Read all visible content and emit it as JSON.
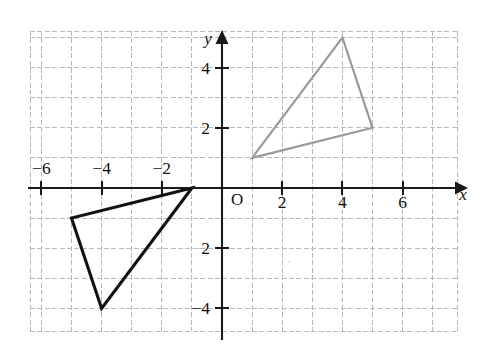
{
  "figure": {
    "origin_label": "O",
    "x_axis_label": "x",
    "y_axis_label": "y"
  },
  "chart_data": {
    "type": "scatter",
    "title": "",
    "xlabel": "x",
    "ylabel": "y",
    "xlim": [
      -7.0,
      7.5
    ],
    "ylim": [
      -4.7,
      5.3
    ],
    "grid": true,
    "grid_spacing": 1,
    "legend": "none",
    "x_tick_labels": [
      "-6",
      "-4",
      "-2",
      "2",
      "4",
      "6"
    ],
    "x_tick_values": [
      -6,
      -4,
      -2,
      2,
      4,
      6
    ],
    "y_tick_labels": [
      "4",
      "2",
      "2",
      "-4"
    ],
    "y_tick_values": [
      4,
      2,
      -2,
      -4
    ],
    "y_tick_note": "The label at y = -2 renders with a very faint, nearly invisible minus sign",
    "annotations": [
      {
        "text": "O",
        "x": 0,
        "y": 0,
        "role": "origin-label"
      },
      {
        "text": "x",
        "x": 7.1,
        "y": -0.55,
        "role": "axis-name"
      },
      {
        "text": "y",
        "x": -0.55,
        "y": 5.15,
        "role": "axis-name"
      }
    ],
    "series": [
      {
        "name": "preimage-triangle",
        "type": "polygon",
        "color": "#121212",
        "line_width": 3.1,
        "closed": true,
        "points": [
          {
            "x": -1,
            "y": 0
          },
          {
            "x": -5,
            "y": -1
          },
          {
            "x": -4,
            "y": -4
          }
        ]
      },
      {
        "name": "image-triangle",
        "type": "polygon",
        "color": "#9a9a9a",
        "line_width": 2.2,
        "closed": true,
        "points": [
          {
            "x": 1,
            "y": 1
          },
          {
            "x": 4,
            "y": 5
          },
          {
            "x": 5,
            "y": 2
          }
        ]
      }
    ]
  },
  "colors": {
    "background": "#ffffff",
    "grid": "#b9b9b9",
    "axis": "#1a1a1a",
    "preimage_stroke": "#121212",
    "image_stroke": "#9a9a9a"
  }
}
